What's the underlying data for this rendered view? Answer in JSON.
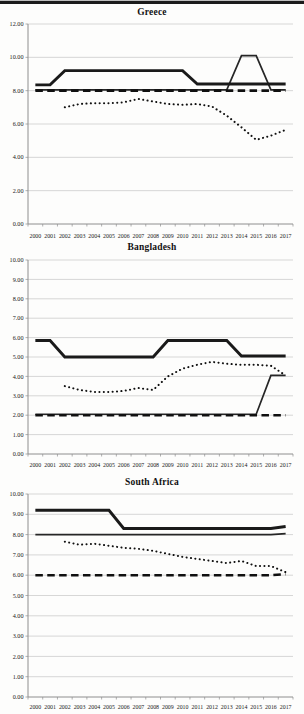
{
  "page": {
    "background": "#fdfdfc",
    "top_border_color": "#1b1b1b"
  },
  "chart_data": [
    {
      "type": "line",
      "title": "Greece",
      "categories": [
        "2000",
        "2001",
        "2002",
        "2003",
        "2004",
        "2005",
        "2006",
        "2007",
        "2008",
        "2009",
        "2010",
        "2011",
        "2012",
        "2013",
        "2014",
        "2015",
        "2016",
        "2017"
      ],
      "ylim": [
        0,
        12
      ],
      "ytick_step": 2,
      "ytick_labels": [
        "0.00",
        "2.00",
        "4.00",
        "6.00",
        "8.00",
        "10.00",
        "12.00"
      ],
      "grid": true,
      "legend": "none",
      "line_color": "#1a1a1a",
      "series": [
        {
          "name": "solid-thick-line",
          "style": "solid_thick",
          "values": [
            8.35,
            8.35,
            9.2,
            9.2,
            9.2,
            9.2,
            9.2,
            9.2,
            9.2,
            9.2,
            9.2,
            8.4,
            8.4,
            8.4,
            8.4,
            8.4,
            8.4,
            8.4
          ]
        },
        {
          "name": "solid-thin-line",
          "style": "solid_thin",
          "values": [
            8.05,
            8.05,
            8.05,
            8.05,
            8.05,
            8.05,
            8.05,
            8.05,
            8.05,
            8.05,
            8.05,
            8.05,
            8.05,
            8.05,
            10.1,
            10.1,
            8.05,
            8.05
          ]
        },
        {
          "name": "dashed-line",
          "style": "dashed",
          "values": [
            8.0,
            8.0,
            8.0,
            8.0,
            8.0,
            8.0,
            8.0,
            8.0,
            8.0,
            8.0,
            8.0,
            8.0,
            8.0,
            8.0,
            8.0,
            8.0,
            8.0,
            8.0
          ]
        },
        {
          "name": "dotted-line",
          "style": "dotted",
          "values": [
            null,
            null,
            7.0,
            7.2,
            7.25,
            7.25,
            7.3,
            7.5,
            7.35,
            7.2,
            7.15,
            7.2,
            7.05,
            6.5,
            5.8,
            5.05,
            5.3,
            5.65
          ]
        }
      ]
    },
    {
      "type": "line",
      "title": "Bangladesh",
      "categories": [
        "2000",
        "2001",
        "2002",
        "2003",
        "2004",
        "2005",
        "2006",
        "2007",
        "2008",
        "2009",
        "2010",
        "2011",
        "2012",
        "2013",
        "2014",
        "2015",
        "2016",
        "2017"
      ],
      "ylim": [
        0,
        10
      ],
      "ytick_step": 1,
      "ytick_labels": [
        "0.00",
        "1.00",
        "2.00",
        "3.00",
        "4.00",
        "5.00",
        "6.00",
        "7.00",
        "8.00",
        "9.00",
        "10.00"
      ],
      "grid": true,
      "legend": "none",
      "line_color": "#1a1a1a",
      "series": [
        {
          "name": "solid-thick-line",
          "style": "solid_thick",
          "values": [
            5.85,
            5.85,
            5.0,
            5.0,
            5.0,
            5.0,
            5.0,
            5.0,
            5.0,
            5.85,
            5.85,
            5.85,
            5.85,
            5.85,
            5.05,
            5.05,
            5.05,
            5.05
          ]
        },
        {
          "name": "solid-thin-line",
          "style": "solid_thin",
          "values": [
            2.05,
            2.05,
            2.05,
            2.05,
            2.05,
            2.05,
            2.05,
            2.05,
            2.05,
            2.05,
            2.05,
            2.05,
            2.05,
            2.05,
            2.05,
            2.05,
            4.05,
            4.05
          ]
        },
        {
          "name": "dashed-line",
          "style": "dashed",
          "values": [
            2.0,
            2.0,
            2.0,
            2.0,
            2.0,
            2.0,
            2.0,
            2.0,
            2.0,
            2.0,
            2.0,
            2.0,
            2.0,
            2.0,
            2.0,
            2.0,
            2.0,
            2.0
          ]
        },
        {
          "name": "dotted-line",
          "style": "dotted",
          "values": [
            null,
            null,
            3.5,
            3.3,
            3.2,
            3.2,
            3.25,
            3.4,
            3.3,
            4.0,
            4.4,
            4.6,
            4.75,
            4.65,
            4.6,
            4.6,
            4.55,
            4.05
          ]
        }
      ]
    },
    {
      "type": "line",
      "title": "South Africa",
      "categories": [
        "2000",
        "2001",
        "2002",
        "2003",
        "2004",
        "2005",
        "2006",
        "2007",
        "2008",
        "2009",
        "2010",
        "2011",
        "2012",
        "2013",
        "2014",
        "2015",
        "2016",
        "2017"
      ],
      "ylim": [
        0,
        10
      ],
      "ytick_step": 1,
      "ytick_labels": [
        "0.00",
        "1.00",
        "2.00",
        "3.00",
        "4.00",
        "5.00",
        "6.00",
        "7.00",
        "8.00",
        "9.00",
        "10.00"
      ],
      "grid": true,
      "legend": "none",
      "line_color": "#1a1a1a",
      "series": [
        {
          "name": "solid-thick-line",
          "style": "solid_thick",
          "values": [
            9.2,
            9.2,
            9.2,
            9.2,
            9.2,
            9.2,
            8.3,
            8.3,
            8.3,
            8.3,
            8.3,
            8.3,
            8.3,
            8.3,
            8.3,
            8.3,
            8.3,
            8.4
          ]
        },
        {
          "name": "solid-thin-line",
          "style": "solid_thin",
          "values": [
            8.0,
            8.0,
            8.0,
            8.0,
            8.0,
            8.0,
            8.0,
            8.0,
            8.0,
            8.0,
            8.0,
            8.0,
            8.0,
            8.0,
            8.0,
            8.0,
            8.0,
            8.05
          ]
        },
        {
          "name": "dashed-line",
          "style": "dashed",
          "values": [
            6.0,
            6.0,
            6.0,
            6.0,
            6.0,
            6.0,
            6.0,
            6.0,
            6.0,
            6.0,
            6.0,
            6.0,
            6.0,
            6.0,
            6.0,
            6.0,
            6.0,
            6.05
          ]
        },
        {
          "name": "dotted-line",
          "style": "dotted",
          "values": [
            null,
            null,
            7.65,
            7.5,
            7.55,
            7.45,
            7.35,
            7.3,
            7.2,
            7.05,
            6.9,
            6.8,
            6.7,
            6.6,
            6.7,
            6.45,
            6.45,
            6.15
          ]
        }
      ]
    }
  ]
}
